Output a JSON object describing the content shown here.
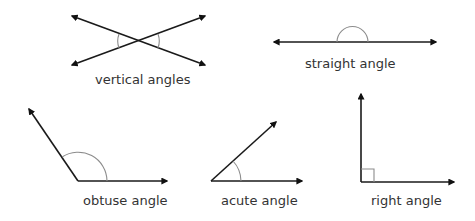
{
  "diagram": {
    "colors": {
      "ray": "#1a1a1a",
      "arc": "#8c8c8c",
      "label": "#333333",
      "background": "#ffffff"
    },
    "figures": [
      {
        "id": "vertical",
        "label": "vertical angles",
        "kind": "two intersecting lines with opposite angle arcs"
      },
      {
        "id": "straight",
        "label": "straight angle",
        "kind": "line with semicircle arc (180°)"
      },
      {
        "id": "obtuse",
        "label": "obtuse angle",
        "kind": "angle greater than 90° with arc"
      },
      {
        "id": "acute",
        "label": "acute angle",
        "kind": "angle less than 90° with arc"
      },
      {
        "id": "right",
        "label": "right angle",
        "kind": "90° angle with square marker"
      }
    ]
  }
}
